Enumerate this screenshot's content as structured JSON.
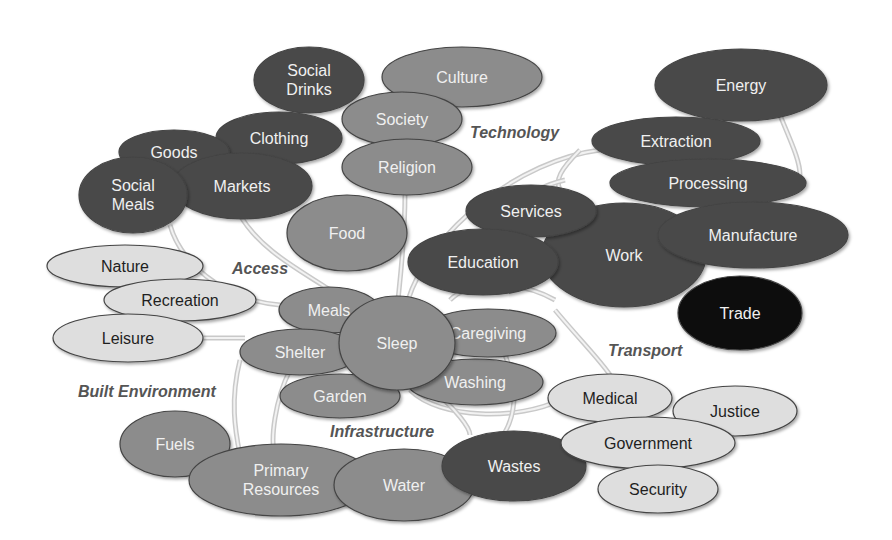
{
  "diagram": {
    "colors": {
      "dark": "#4a4a4a",
      "medium": "#8c8c8c",
      "light": "#dedede",
      "black": "#080808",
      "text_on_dark": "#f0f0f0",
      "text_on_light": "#1f1f1f"
    },
    "group_labels": [
      {
        "text": "Technology",
        "x": 470,
        "y": 138
      },
      {
        "text": "Access",
        "x": 232,
        "y": 274
      },
      {
        "text": "Built Environment",
        "x": 78,
        "y": 397
      },
      {
        "text": "Infrastructure",
        "x": 330,
        "y": 437
      },
      {
        "text": "Transport",
        "x": 608,
        "y": 356
      }
    ],
    "nodes": [
      {
        "id": "culture",
        "label": "Culture",
        "cx": 462,
        "cy": 77,
        "rx": 80,
        "ry": 30,
        "tone": "medium"
      },
      {
        "id": "social-drinks",
        "label": "Social|Drinks",
        "cx": 309,
        "cy": 80,
        "rx": 55,
        "ry": 33,
        "tone": "dark"
      },
      {
        "id": "society",
        "label": "Society",
        "cx": 402,
        "cy": 119,
        "rx": 60,
        "ry": 27,
        "tone": "medium"
      },
      {
        "id": "religion",
        "label": "Religion",
        "cx": 407,
        "cy": 167,
        "rx": 65,
        "ry": 28,
        "tone": "medium"
      },
      {
        "id": "clothing",
        "label": "Clothing",
        "cx": 279,
        "cy": 138,
        "rx": 63,
        "ry": 26,
        "tone": "dark"
      },
      {
        "id": "goods",
        "label": "Goods",
        "cx": 174,
        "cy": 152,
        "rx": 55,
        "ry": 22,
        "tone": "dark"
      },
      {
        "id": "markets",
        "label": "Markets",
        "cx": 242,
        "cy": 186,
        "rx": 70,
        "ry": 33,
        "tone": "dark"
      },
      {
        "id": "social-meals",
        "label": "Social|Meals",
        "cx": 133,
        "cy": 195,
        "rx": 54,
        "ry": 38,
        "tone": "dark"
      },
      {
        "id": "food",
        "label": "Food",
        "cx": 347,
        "cy": 233,
        "rx": 60,
        "ry": 38,
        "tone": "medium"
      },
      {
        "id": "energy",
        "label": "Energy",
        "cx": 741,
        "cy": 85,
        "rx": 86,
        "ry": 36,
        "tone": "dark"
      },
      {
        "id": "extraction",
        "label": "Extraction",
        "cx": 676,
        "cy": 141,
        "rx": 84,
        "ry": 24,
        "tone": "dark"
      },
      {
        "id": "processing",
        "label": "Processing",
        "cx": 708,
        "cy": 183,
        "rx": 98,
        "ry": 24,
        "tone": "dark"
      },
      {
        "id": "work",
        "label": "Work",
        "cx": 624,
        "cy": 255,
        "rx": 82,
        "ry": 52,
        "tone": "dark"
      },
      {
        "id": "services",
        "label": "Services",
        "cx": 531,
        "cy": 211,
        "rx": 65,
        "ry": 26,
        "tone": "dark"
      },
      {
        "id": "education",
        "label": "Education",
        "cx": 483,
        "cy": 262,
        "rx": 75,
        "ry": 33,
        "tone": "dark"
      },
      {
        "id": "manufacture",
        "label": "Manufacture",
        "cx": 753,
        "cy": 235,
        "rx": 95,
        "ry": 33,
        "tone": "dark"
      },
      {
        "id": "trade",
        "label": "Trade",
        "cx": 740,
        "cy": 313,
        "rx": 62,
        "ry": 37,
        "tone": "black"
      },
      {
        "id": "nature",
        "label": "Nature",
        "cx": 125,
        "cy": 266,
        "rx": 78,
        "ry": 21,
        "tone": "light"
      },
      {
        "id": "recreation",
        "label": "Recreation",
        "cx": 180,
        "cy": 300,
        "rx": 76,
        "ry": 21,
        "tone": "light"
      },
      {
        "id": "leisure",
        "label": "Leisure",
        "cx": 128,
        "cy": 338,
        "rx": 75,
        "ry": 24,
        "tone": "light"
      },
      {
        "id": "meals",
        "label": "Meals",
        "cx": 329,
        "cy": 310,
        "rx": 50,
        "ry": 23,
        "tone": "medium"
      },
      {
        "id": "shelter",
        "label": "Shelter",
        "cx": 300,
        "cy": 352,
        "rx": 60,
        "ry": 23,
        "tone": "medium"
      },
      {
        "id": "garden",
        "label": "Garden",
        "cx": 340,
        "cy": 396,
        "rx": 60,
        "ry": 22,
        "tone": "medium"
      },
      {
        "id": "washing",
        "label": "Washing",
        "cx": 475,
        "cy": 382,
        "rx": 68,
        "ry": 23,
        "tone": "medium"
      },
      {
        "id": "caregiving",
        "label": "Caregiving",
        "cx": 488,
        "cy": 333,
        "rx": 68,
        "ry": 24,
        "tone": "medium"
      },
      {
        "id": "sleep",
        "label": "Sleep",
        "cx": 397,
        "cy": 343,
        "rx": 58,
        "ry": 47,
        "tone": "medium"
      },
      {
        "id": "fuels",
        "label": "Fuels",
        "cx": 175,
        "cy": 444,
        "rx": 55,
        "ry": 33,
        "tone": "medium"
      },
      {
        "id": "primary-resources",
        "label": "Primary|Resources",
        "cx": 281,
        "cy": 480,
        "rx": 92,
        "ry": 36,
        "tone": "medium"
      },
      {
        "id": "water",
        "label": "Water",
        "cx": 404,
        "cy": 485,
        "rx": 70,
        "ry": 36,
        "tone": "medium"
      },
      {
        "id": "wastes",
        "label": "Wastes",
        "cx": 514,
        "cy": 466,
        "rx": 72,
        "ry": 35,
        "tone": "dark"
      },
      {
        "id": "medical",
        "label": "Medical",
        "cx": 610,
        "cy": 398,
        "rx": 62,
        "ry": 24,
        "tone": "light"
      },
      {
        "id": "justice",
        "label": "Justice",
        "cx": 735,
        "cy": 411,
        "rx": 62,
        "ry": 25,
        "tone": "light"
      },
      {
        "id": "government",
        "label": "Government",
        "cx": 648,
        "cy": 443,
        "rx": 87,
        "ry": 26,
        "tone": "light"
      },
      {
        "id": "security",
        "label": "Security",
        "cx": 658,
        "cy": 489,
        "rx": 60,
        "ry": 24,
        "tone": "light"
      }
    ],
    "connectors": [
      "M 405 192 C 405 240, 400 280, 398 300",
      "M 408 300 C 430 230, 520 160, 600 150",
      "M 240 215 C 260 250, 300 270, 330 290",
      "M 170 225 C 180 260, 220 300, 280 305",
      "M 200 338 L 245 338",
      "M 240 360 C 230 400, 235 430, 240 455",
      "M 290 370 C 275 400, 270 440, 275 455",
      "M 410 390 C 440 420, 520 420, 560 400",
      "M 420 380 C 460 410, 470 430, 470 435",
      "M 505 355 C 520 390, 515 420, 500 440",
      "M 450 300 C 470 280, 520 280, 555 300",
      "M 555 310 C 580 340, 600 360, 610 375",
      "M 580 150 C 560 170, 555 180, 560 190",
      "M 780 115 C 790 140, 800 160, 800 175",
      "M 565 180 C 520 190, 480 230, 455 290"
    ]
  }
}
